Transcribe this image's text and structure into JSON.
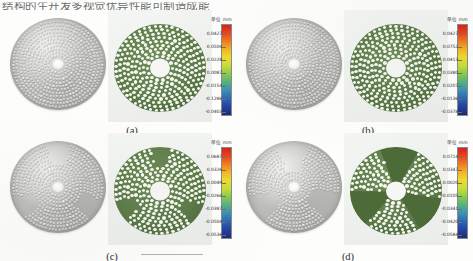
{
  "header": {
    "truncated_text": "结构的生开发多视觉优异性能可制造成能"
  },
  "figure": {
    "bottom_rule": "horizontal-rule",
    "colorbar_unit_label": "单位 mm",
    "colorbar_colors": [
      "#d8231b",
      "#f07c22",
      "#f4b524",
      "#eddb2c",
      "#8ccb4a",
      "#3b93b4",
      "#2544a2",
      "#1b2a78"
    ]
  },
  "panels": [
    {
      "id": "a",
      "label": "(a)",
      "cad_model": "perforated-disc-spiral-dense",
      "fea_plot": "deformation-contour-green",
      "colorbar": {
        "unit": "单位 mm",
        "ticks": [
          "0.0427",
          "0.0504",
          "0.0228",
          "0.0087",
          "-0.0154",
          "-0.1286",
          "-0.0403"
        ]
      }
    },
    {
      "id": "b",
      "label": "(b)",
      "cad_model": "perforated-disc-spiral-swirl",
      "fea_plot": "deformation-contour-green",
      "colorbar": {
        "unit": "单位 mm",
        "ticks": [
          "0.0427",
          "0.0752",
          "0.0413",
          "0.0380",
          "0.0207",
          "-0.0136",
          "-0.0378"
        ]
      }
    },
    {
      "id": "c",
      "label": "(c)",
      "cad_model": "perforated-disc-sector-patches",
      "fea_plot": "deformation-contour-green",
      "colorbar": {
        "unit": "单位 mm",
        "ticks": [
          "0.0687",
          "0.0326",
          "0.0049",
          "-0.0266",
          "-0.0387",
          "-0.0504",
          "-0.0536"
        ]
      }
    },
    {
      "id": "d",
      "label": "(d)",
      "cad_model": "perforated-disc-radial-blocks",
      "fea_plot": "deformation-contour-green-solid-sectors",
      "colorbar": {
        "unit": "单位 mm",
        "ticks": [
          "0.0714",
          "0.0347",
          "0.0020",
          "-0.0105",
          "-0.0341",
          "-0.0420",
          "-0.0584"
        ]
      }
    }
  ],
  "chart_data": {
    "type": "heatmap",
    "xlabel": "",
    "ylabel": "",
    "unit": "mm",
    "legend_position": "right",
    "grid": false,
    "series": [
      {
        "name": "(a)",
        "colorbar_ticks": [
          0.0427,
          0.0504,
          0.0228,
          0.0087,
          -0.0154,
          -0.1286,
          -0.0403
        ],
        "range": [
          -0.0403,
          0.0427
        ]
      },
      {
        "name": "(b)",
        "colorbar_ticks": [
          0.0427,
          0.0752,
          0.0413,
          0.038,
          0.0207,
          -0.0136,
          -0.0378
        ],
        "range": [
          -0.0378,
          0.0427
        ]
      },
      {
        "name": "(c)",
        "colorbar_ticks": [
          0.0687,
          0.0326,
          0.0049,
          -0.0266,
          -0.0387,
          -0.0504,
          -0.0536
        ],
        "range": [
          -0.0536,
          0.0687
        ]
      },
      {
        "name": "(d)",
        "colorbar_ticks": [
          0.0714,
          0.0347,
          0.002,
          -0.0105,
          -0.0341,
          -0.042,
          -0.0584
        ],
        "range": [
          -0.0584,
          0.0714
        ]
      }
    ]
  }
}
